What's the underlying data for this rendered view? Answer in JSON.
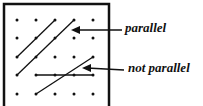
{
  "diagram": {
    "grid": {
      "rows": 5,
      "cols": 5
    },
    "labels": {
      "parallel": "parallel",
      "not_parallel": "not parallel"
    },
    "colors": {
      "ink": "#111111",
      "background": "#ffffff"
    }
  }
}
